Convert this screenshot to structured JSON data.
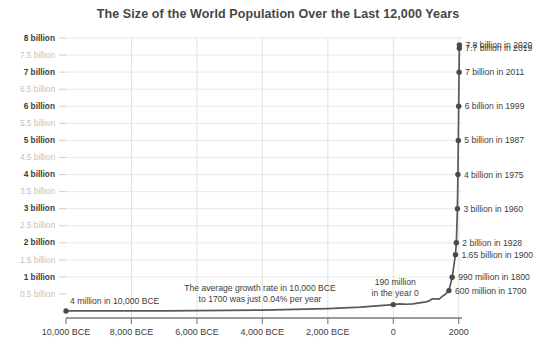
{
  "chart_data": {
    "type": "line",
    "title": "The Size of the World Population Over the Last 12,000 Years",
    "xlabel": "",
    "ylabel": "",
    "xlim": [
      -10000,
      2100
    ],
    "ylim": [
      0,
      8.2
    ],
    "grid": true,
    "legend": "none",
    "x_ticks": [
      {
        "value": -10000,
        "label": "10,000 BCE"
      },
      {
        "value": -8000,
        "label": "8,000 BCE"
      },
      {
        "value": -6000,
        "label": "6,000 BCE"
      },
      {
        "value": -4000,
        "label": "4,000 BCE"
      },
      {
        "value": -2000,
        "label": "2,000 BCE"
      },
      {
        "value": 0,
        "label": "0"
      },
      {
        "value": 2000,
        "label": "2000"
      }
    ],
    "y_ticks": [
      {
        "value": 0.5,
        "label": "0.5 billion",
        "major": false
      },
      {
        "value": 1.0,
        "label": "1 billion",
        "major": true
      },
      {
        "value": 1.5,
        "label": "1.5 billion",
        "major": false
      },
      {
        "value": 2.0,
        "label": "2 billion",
        "major": true
      },
      {
        "value": 2.5,
        "label": "2.5 billion",
        "major": false
      },
      {
        "value": 3.0,
        "label": "3 billion",
        "major": true
      },
      {
        "value": 3.5,
        "label": "3.5 billion",
        "major": false
      },
      {
        "value": 4.0,
        "label": "4 billion",
        "major": true
      },
      {
        "value": 4.5,
        "label": "4.5 billion",
        "major": false
      },
      {
        "value": 5.0,
        "label": "5 billion",
        "major": true
      },
      {
        "value": 5.5,
        "label": "5.5 billion",
        "major": false
      },
      {
        "value": 6.0,
        "label": "6 billion",
        "major": true
      },
      {
        "value": 6.5,
        "label": "6.5 billion",
        "major": false
      },
      {
        "value": 7.0,
        "label": "7 billion",
        "major": true
      },
      {
        "value": 7.5,
        "label": "7.5 billion",
        "major": false
      },
      {
        "value": 8.0,
        "label": "8 billion",
        "major": true
      }
    ],
    "series": [
      {
        "name": "World population",
        "units": "billions",
        "points": [
          {
            "x": -10000,
            "y": 0.004
          },
          {
            "x": -9000,
            "y": 0.005
          },
          {
            "x": -8000,
            "y": 0.006
          },
          {
            "x": -7000,
            "y": 0.008
          },
          {
            "x": -6000,
            "y": 0.012
          },
          {
            "x": -5000,
            "y": 0.02
          },
          {
            "x": -4000,
            "y": 0.028
          },
          {
            "x": -3000,
            "y": 0.05
          },
          {
            "x": -2000,
            "y": 0.072
          },
          {
            "x": -1000,
            "y": 0.115
          },
          {
            "x": -500,
            "y": 0.15
          },
          {
            "x": 0,
            "y": 0.19
          },
          {
            "x": 200,
            "y": 0.21
          },
          {
            "x": 400,
            "y": 0.2
          },
          {
            "x": 600,
            "y": 0.21
          },
          {
            "x": 800,
            "y": 0.24
          },
          {
            "x": 1000,
            "y": 0.27
          },
          {
            "x": 1100,
            "y": 0.3
          },
          {
            "x": 1200,
            "y": 0.36
          },
          {
            "x": 1300,
            "y": 0.36
          },
          {
            "x": 1400,
            "y": 0.35
          },
          {
            "x": 1500,
            "y": 0.43
          },
          {
            "x": 1600,
            "y": 0.5
          },
          {
            "x": 1700,
            "y": 0.6
          },
          {
            "x": 1800,
            "y": 0.99
          },
          {
            "x": 1900,
            "y": 1.65
          },
          {
            "x": 1928,
            "y": 2.0
          },
          {
            "x": 1960,
            "y": 3.0
          },
          {
            "x": 1975,
            "y": 4.0
          },
          {
            "x": 1987,
            "y": 5.0
          },
          {
            "x": 1999,
            "y": 6.0
          },
          {
            "x": 2011,
            "y": 7.0
          },
          {
            "x": 2019,
            "y": 7.7
          },
          {
            "x": 2020,
            "y": 7.8
          }
        ]
      }
    ],
    "markers": [
      {
        "x": -10000,
        "y": 0.004,
        "label": "4 million in 10,000 BCE",
        "side": "left"
      },
      {
        "x": 0,
        "y": 0.19,
        "label": "190 million|in the year 0",
        "side": "above"
      },
      {
        "x": 1700,
        "y": 0.6,
        "label": "600 million in 1700",
        "side": "right"
      },
      {
        "x": 1800,
        "y": 0.99,
        "label": "990 million in 1800",
        "side": "right"
      },
      {
        "x": 1900,
        "y": 1.65,
        "label": "1.65 billion in 1900",
        "side": "right"
      },
      {
        "x": 1928,
        "y": 2.0,
        "label": "2 billion in 1928",
        "side": "right"
      },
      {
        "x": 1960,
        "y": 3.0,
        "label": "3 billion in 1960",
        "side": "right"
      },
      {
        "x": 1975,
        "y": 4.0,
        "label": "4 billion in 1975",
        "side": "right"
      },
      {
        "x": 1987,
        "y": 5.0,
        "label": "5 billion in 1987",
        "side": "right"
      },
      {
        "x": 1999,
        "y": 6.0,
        "label": "6 billion in 1999",
        "side": "right"
      },
      {
        "x": 2011,
        "y": 7.0,
        "label": "7 billion in 2011",
        "side": "right"
      },
      {
        "x": 2019,
        "y": 7.7,
        "label": "7.7 billion in 2019",
        "side": "right"
      },
      {
        "x": 2020,
        "y": 7.8,
        "label": "7.8 billion in 2020",
        "side": "right"
      }
    ],
    "annotations": [
      {
        "name": "growth-rate-note",
        "lines": [
          "The average growth rate in 10,000 BCE",
          "to 1700 was just 0.04% per year"
        ]
      }
    ],
    "colors": {
      "line": "#595959",
      "dot": "#4a4a4a",
      "grid": "#e3e3e3",
      "axis": "#7a7a7a",
      "text": "#3d3d3d",
      "text_muted": "#c3c3c3",
      "title": "#464646",
      "background": "#ffffff"
    }
  }
}
